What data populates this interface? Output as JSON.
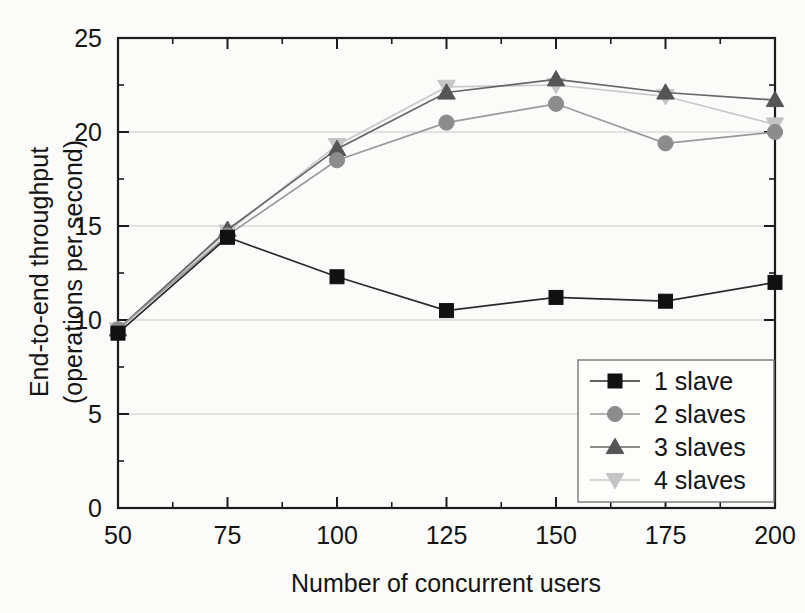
{
  "chart_data": {
    "type": "line",
    "title": "",
    "xlabel": "Number of concurrent users",
    "ylabel": "End-to-end throughput (operations per second)",
    "ylabel_line1": "End-to-end throughput",
    "ylabel_line2": "(operations per second)",
    "x": [
      50,
      75,
      100,
      125,
      150,
      175,
      200
    ],
    "xticks": [
      "50",
      "75",
      "100",
      "125",
      "150",
      "175",
      "200"
    ],
    "yticks": [
      "0",
      "5",
      "10",
      "15",
      "20",
      "25"
    ],
    "xlim": [
      50,
      200
    ],
    "ylim": [
      0,
      25
    ],
    "grid": true,
    "grid_axis": "y",
    "legend_position": "bottom-right",
    "series": [
      {
        "name": "1 slave",
        "marker": "square",
        "color": "#111111",
        "line_color": "#2a2a2a",
        "values": [
          9.3,
          14.4,
          12.3,
          10.5,
          11.2,
          11.0,
          12.0
        ]
      },
      {
        "name": "2 slaves",
        "marker": "circle",
        "color": "#8c8c8c",
        "line_color": "#9a9a9a",
        "values": [
          9.5,
          14.5,
          18.5,
          20.5,
          21.5,
          19.4,
          20.0
        ]
      },
      {
        "name": "3 slaves",
        "marker": "triangle-up",
        "color": "#555555",
        "line_color": "#666666",
        "values": [
          9.5,
          14.8,
          19.1,
          22.1,
          22.8,
          22.1,
          21.7
        ]
      },
      {
        "name": "4 slaves",
        "marker": "triangle-down",
        "color": "#c4c4c4",
        "line_color": "#c9c9c9",
        "values": [
          9.5,
          14.7,
          19.3,
          22.4,
          22.5,
          21.9,
          20.4
        ]
      }
    ]
  },
  "legend": {
    "items": [
      {
        "label": "1 slave"
      },
      {
        "label": "2 slaves"
      },
      {
        "label": "3 slaves"
      },
      {
        "label": "4 slaves"
      }
    ]
  },
  "colors": {
    "background": "#fbfbf9",
    "axis": "#1c1c1c",
    "grid": "#c9c9c9",
    "series_1": "#111111",
    "series_2": "#8c8c8c",
    "series_3": "#555555",
    "series_4": "#c4c4c4"
  }
}
